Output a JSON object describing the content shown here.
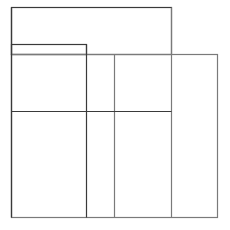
{
  "canvas": {
    "width": 230,
    "height": 230,
    "background": "#ffffff"
  },
  "diagram": {
    "stroke_dark": "#3a3a3a",
    "stroke_light": "#7a7a7a",
    "rectangles": [
      {
        "name": "top-rect",
        "x": 11,
        "y": 7,
        "w": 160,
        "h": 47
      },
      {
        "name": "small-rect",
        "x": 11,
        "y": 44,
        "w": 75,
        "h": 10
      },
      {
        "name": "main-grid",
        "x": 11,
        "y": 54,
        "w": 206,
        "h": 163
      }
    ],
    "lines": [
      {
        "name": "v-line-86",
        "x1": 86,
        "y1": 44,
        "x2": 86,
        "y2": 217
      },
      {
        "name": "v-line-114",
        "x1": 114,
        "y1": 54,
        "x2": 114,
        "y2": 217
      },
      {
        "name": "v-line-171",
        "x1": 171,
        "y1": 7,
        "x2": 171,
        "y2": 217
      },
      {
        "name": "h-line-111",
        "x1": 11,
        "y1": 111,
        "x2": 171,
        "y2": 111
      }
    ]
  }
}
